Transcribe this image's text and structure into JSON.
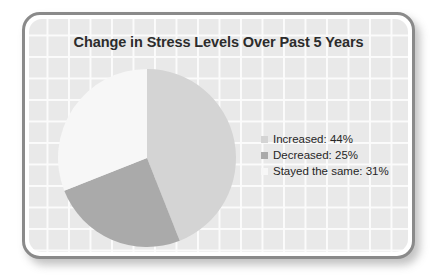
{
  "card": {
    "border_color": "#8a8a8a",
    "background_color": "#e9e9e9",
    "gridline_color": "#fbfbfb"
  },
  "chart_data": {
    "type": "pie",
    "title": "Change in Stress Levels Over Past 5 Years",
    "xlabel": "",
    "ylabel": "",
    "start_angle_oclock": 12,
    "direction": "clockwise",
    "categories": [
      "Increased",
      "Decreased",
      "Stayed the same"
    ],
    "values": [
      44,
      25,
      31
    ],
    "unit": "%",
    "colors": [
      "#d4d4d4",
      "#aaaaaa",
      "#f7f7f7"
    ],
    "legend_position": "right",
    "grid": true,
    "slices": [
      {
        "label": "Increased",
        "value": 44,
        "color": "#d4d4d4",
        "legend_text": "Increased: 44%"
      },
      {
        "label": "Decreased",
        "value": 25,
        "color": "#aaaaaa",
        "legend_text": "Decreased: 25%"
      },
      {
        "label": "Stayed the same",
        "value": 31,
        "color": "#f7f7f7",
        "legend_text": "Stayed the same: 31%"
      }
    ]
  },
  "legend": {
    "items": [
      {
        "text": "Increased: 44%",
        "color": "#d4d4d4"
      },
      {
        "text": "Decreased: 25%",
        "color": "#aaaaaa"
      },
      {
        "text": "Stayed the same: 31%",
        "color": "#f7f7f7"
      }
    ]
  }
}
